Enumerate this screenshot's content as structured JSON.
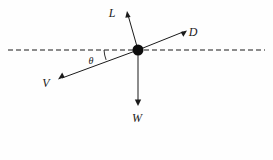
{
  "figure": {
    "background_color": "#fefefe",
    "stroke_color": "#1a1a1a",
    "width": 273,
    "height": 160
  },
  "origin": {
    "label": "body-point",
    "x": 138,
    "y": 50,
    "radius": 5.5,
    "color": "#0d0d0d"
  },
  "horizontal_reference": {
    "name": "horizontal-dashed-axis",
    "x1": 8,
    "y1": 50,
    "x2": 265,
    "y2": 50,
    "dash": "5 3"
  },
  "angle": {
    "symbol": "θ",
    "arc_center_x": 138,
    "arc_center_y": 50,
    "arc_radius": 34,
    "label_x": 90,
    "label_y": 64
  },
  "vectors": [
    {
      "name": "lift-vector",
      "label": "L",
      "tip_x": 127,
      "tip_y": 12,
      "label_x": 112,
      "label_y": 17
    },
    {
      "name": "drag-vector",
      "label": "D",
      "tip_x": 186,
      "tip_y": 31,
      "label_x": 192,
      "label_y": 36
    },
    {
      "name": "velocity-vector",
      "label": "V",
      "tip_x": 59,
      "tip_y": 79,
      "label_x": 45,
      "label_y": 87
    },
    {
      "name": "weight-vector",
      "label": "W",
      "tip_x": 138,
      "tip_y": 105,
      "label_x": 132,
      "label_y": 122
    }
  ]
}
